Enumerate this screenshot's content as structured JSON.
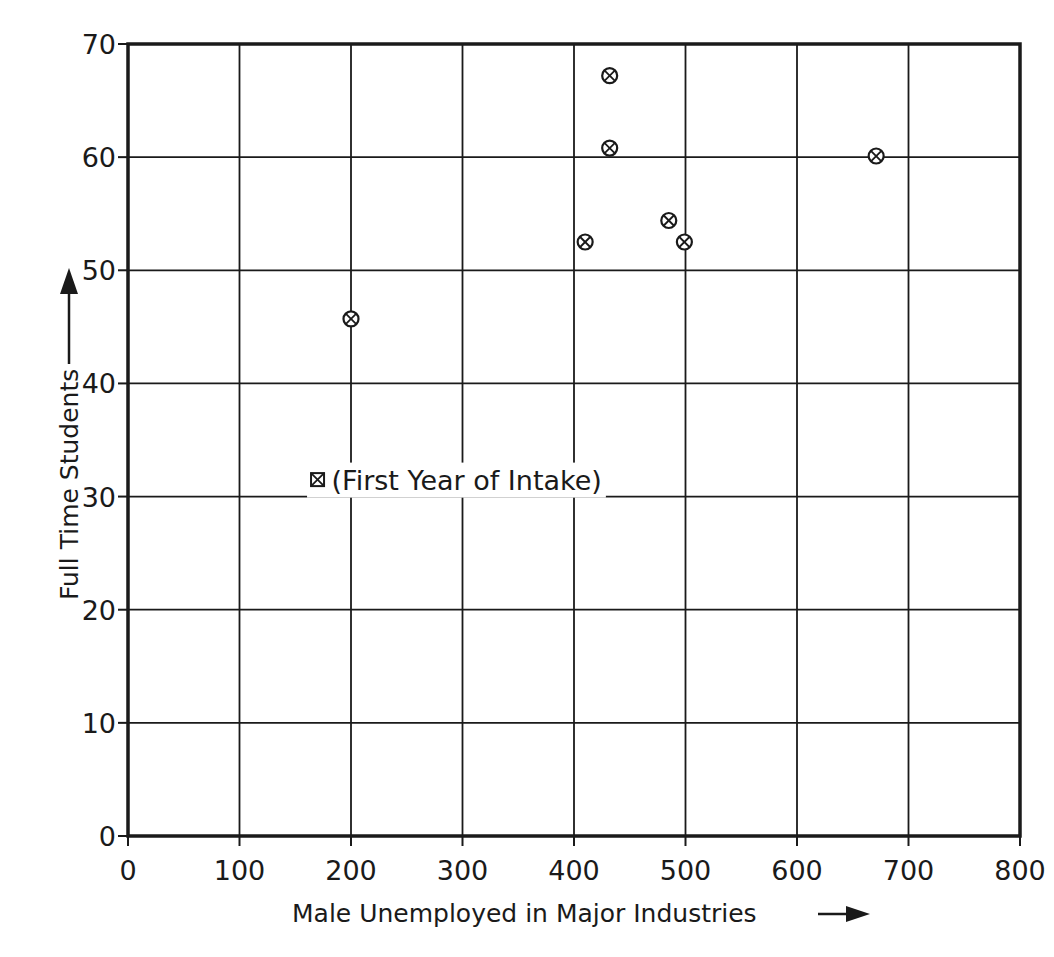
{
  "chart_data": {
    "type": "scatter",
    "title": "",
    "xlabel": "Male Unemployed in Major Industries",
    "ylabel": "Full Time Students",
    "xlabel_arrow": "→",
    "ylabel_arrow": "↑",
    "xlim": [
      0,
      800
    ],
    "ylim": [
      0,
      70
    ],
    "x_ticks": [
      0,
      100,
      200,
      300,
      400,
      500,
      600,
      700,
      800
    ],
    "y_ticks": [
      0,
      10,
      20,
      30,
      40,
      50,
      60,
      70
    ],
    "x_tick_labels": [
      "0",
      "100",
      "200",
      "300",
      "400",
      "500",
      "600",
      "700",
      "800"
    ],
    "y_tick_labels": [
      "0",
      "10",
      "20",
      "30",
      "40",
      "50",
      "60",
      "70"
    ],
    "grid": true,
    "series": [
      {
        "name": "Colleges",
        "marker": "circle-x",
        "points": [
          {
            "x": 200,
            "y": 45.7
          },
          {
            "x": 410,
            "y": 52.5
          },
          {
            "x": 432,
            "y": 67.2
          },
          {
            "x": 432,
            "y": 60.8
          },
          {
            "x": 485,
            "y": 54.4
          },
          {
            "x": 499,
            "y": 52.5
          },
          {
            "x": 671,
            "y": 60.1
          }
        ]
      }
    ],
    "legend": {
      "marker": "square-x",
      "text": "(First Year of Intake)",
      "position": {
        "x": 170,
        "y": 31.5
      }
    },
    "colors": {
      "ink": "#1a1a1a",
      "background": "#ffffff"
    }
  }
}
